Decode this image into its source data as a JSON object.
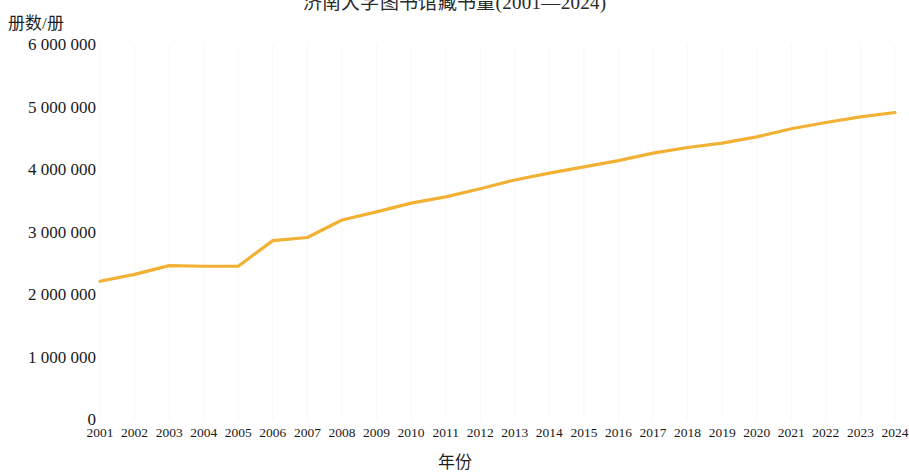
{
  "chart_data": {
    "type": "line",
    "title": "济南大学图书馆藏书量(2001—2024)",
    "xlabel": "年份",
    "ylabel": "册数/册",
    "grid": "vertical-only",
    "legend": "none",
    "line_color": "#F2B134",
    "xlim": [
      2001,
      2024
    ],
    "ylim": [
      0,
      6000000
    ],
    "y_ticks": [
      0,
      1000000,
      2000000,
      3000000,
      4000000,
      5000000,
      6000000
    ],
    "y_tick_labels": [
      "0",
      "1 000 000",
      "2 000 000",
      "3 000 000",
      "4 000 000",
      "5 000 000",
      "6 000 000"
    ],
    "categories": [
      "2001",
      "2002",
      "2003",
      "2004",
      "2005",
      "2006",
      "2007",
      "2008",
      "2009",
      "2010",
      "2011",
      "2012",
      "2013",
      "2014",
      "2015",
      "2016",
      "2017",
      "2018",
      "2019",
      "2020",
      "2021",
      "2022",
      "2023",
      "2024"
    ],
    "series": [
      {
        "name": "馆藏册数",
        "values": [
          2220000,
          2330000,
          2470000,
          2460000,
          2460000,
          2870000,
          2920000,
          3200000,
          3330000,
          3470000,
          3570000,
          3700000,
          3840000,
          3950000,
          4050000,
          4150000,
          4270000,
          4360000,
          4430000,
          4530000,
          4660000,
          4760000,
          4850000,
          4920000
        ]
      }
    ]
  }
}
